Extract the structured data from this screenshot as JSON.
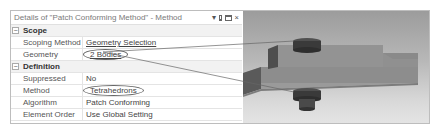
{
  "panel": {
    "title": "Details of \"Patch Conforming Method\" - Method",
    "controls": {
      "dropdown": "▾",
      "pin": "pin",
      "maximize": "maximize",
      "close": "×"
    }
  },
  "sections": [
    {
      "name": "Scope",
      "collapse": "−",
      "rows": [
        {
          "label": "Scoping Method",
          "value": "Geometry Selection"
        },
        {
          "label": "Geometry",
          "value": "2 Bodies"
        }
      ]
    },
    {
      "name": "Definition",
      "collapse": "−",
      "rows": [
        {
          "label": "Suppressed",
          "value": "No"
        },
        {
          "label": "Method",
          "value": "Tetrahedrons"
        },
        {
          "label": "Algorithm",
          "value": "Patch Conforming"
        },
        {
          "label": "Element Order",
          "value": "Use Global Setting"
        }
      ]
    }
  ],
  "viewport": {
    "description": "3D model: stepped plate with two cylindrical bodies (top and bottom)",
    "colors": {
      "plate": "#8f8f8f",
      "cylinder": "#3a3a3a",
      "background_top": "#9c9c9c",
      "background_bottom": "#e4e4e4"
    }
  }
}
